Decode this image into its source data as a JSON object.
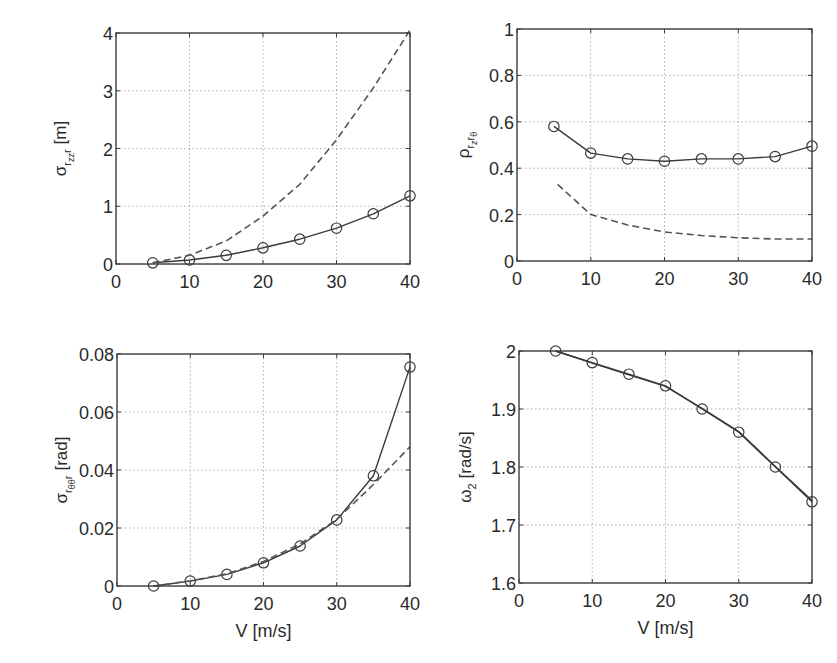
{
  "figure": {
    "background": "#ffffff",
    "line_color": "#3a3a3a",
    "dashed_color": "#555555",
    "grid_color": "#9a9a9a"
  },
  "chart_data": [
    {
      "id": "top-left",
      "type": "line",
      "title": "",
      "xlabel": "",
      "ylabel": {
        "symbol": "σ",
        "sub": "r",
        "subsub": "zz",
        "sub2": "r",
        "unit": "[m]"
      },
      "xlim": [
        0,
        40
      ],
      "ylim": [
        0,
        4
      ],
      "xticks": [
        0,
        10,
        20,
        30,
        40
      ],
      "yticks": [
        0,
        1,
        2,
        3,
        4
      ],
      "grid": true,
      "frame": {
        "x0": 116,
        "y0": 33,
        "x1": 410,
        "y1": 264
      },
      "x": [
        5,
        10,
        15,
        20,
        25,
        30,
        35,
        40
      ],
      "series": [
        {
          "name": "solid-with-markers",
          "style": "solid",
          "marker": "circle",
          "values": [
            0.02,
            0.07,
            0.15,
            0.28,
            0.43,
            0.62,
            0.87,
            1.18
          ]
        },
        {
          "name": "dashed",
          "style": "dashed",
          "marker": "none",
          "x": [
            5,
            10,
            15,
            20,
            25,
            30,
            35,
            40
          ],
          "values": [
            0.02,
            0.15,
            0.4,
            0.83,
            1.38,
            2.15,
            3.05,
            4.05
          ]
        }
      ]
    },
    {
      "id": "top-right",
      "type": "line",
      "title": "",
      "xlabel": "",
      "ylabel": {
        "symbol": "ρ",
        "sub": "r",
        "subsub": "z",
        "sub2": "r",
        "subsub2": "θ",
        "unit": ""
      },
      "xlim": [
        0,
        40
      ],
      "ylim": [
        0,
        1
      ],
      "xticks": [
        0,
        10,
        20,
        30,
        40
      ],
      "yticks": [
        0,
        0.2,
        0.4,
        0.6,
        0.8,
        1
      ],
      "ytick_labels": [
        "0",
        "0.2",
        "0.4",
        "0.6",
        "0.8",
        "1"
      ],
      "grid": true,
      "frame": {
        "x0": 517,
        "y0": 29,
        "x1": 812,
        "y1": 261
      },
      "x": [
        5,
        10,
        15,
        20,
        25,
        30,
        35,
        40
      ],
      "series": [
        {
          "name": "solid-with-markers",
          "style": "solid",
          "marker": "circle",
          "values": [
            0.58,
            0.465,
            0.44,
            0.43,
            0.44,
            0.44,
            0.45,
            0.495
          ]
        },
        {
          "name": "dashed",
          "style": "dashed",
          "marker": "none",
          "x": [
            5.5,
            10,
            15,
            20,
            25,
            30,
            35,
            40
          ],
          "values": [
            0.33,
            0.2,
            0.155,
            0.125,
            0.11,
            0.1,
            0.095,
            0.095
          ]
        }
      ]
    },
    {
      "id": "bottom-left",
      "type": "line",
      "title": "",
      "xlabel": "V [m/s]",
      "ylabel": {
        "symbol": "σ",
        "sub": "r",
        "subsub": "θθ",
        "sub2": "r",
        "unit": "[rad]"
      },
      "xlim": [
        0,
        40
      ],
      "ylim": [
        0,
        0.08
      ],
      "xticks": [
        0,
        10,
        20,
        30,
        40
      ],
      "yticks": [
        0,
        0.02,
        0.04,
        0.06,
        0.08
      ],
      "ytick_labels": [
        "0",
        "0.02",
        "0.04",
        "0.06",
        "0.08"
      ],
      "grid": true,
      "frame": {
        "x0": 117,
        "y0": 354,
        "x1": 410,
        "y1": 586
      },
      "x": [
        5,
        10,
        15,
        20,
        25,
        30,
        35,
        40
      ],
      "series": [
        {
          "name": "solid-with-markers",
          "style": "solid",
          "marker": "circle",
          "values": [
            0.0,
            0.0017,
            0.004,
            0.008,
            0.0138,
            0.0228,
            0.038,
            0.0755
          ]
        },
        {
          "name": "dashed",
          "style": "dashed",
          "marker": "none",
          "x": [
            5,
            10,
            15,
            20,
            25,
            30,
            35,
            40
          ],
          "values": [
            0.0,
            0.0018,
            0.0042,
            0.0085,
            0.0145,
            0.023,
            0.035,
            0.048
          ]
        }
      ]
    },
    {
      "id": "bottom-right",
      "type": "line",
      "title": "",
      "xlabel": "V [m/s]",
      "ylabel": {
        "symbol": "ω",
        "sub": "2",
        "unit": "[rad/s]"
      },
      "xlim": [
        0,
        40
      ],
      "ylim": [
        1.6,
        2.0
      ],
      "xticks": [
        0,
        10,
        20,
        30,
        40
      ],
      "yticks": [
        1.6,
        1.7,
        1.8,
        1.9,
        2.0
      ],
      "ytick_labels": [
        "1.6",
        "1.7",
        "1.8",
        "1.9",
        "2"
      ],
      "grid": true,
      "frame": {
        "x0": 519,
        "y0": 351,
        "x1": 812,
        "y1": 583
      },
      "x": [
        5,
        10,
        15,
        20,
        25,
        30,
        35,
        40
      ],
      "series": [
        {
          "name": "solid-with-markers",
          "style": "solid",
          "marker": "circle",
          "values": [
            2.0,
            1.98,
            1.96,
            1.94,
            1.9,
            1.86,
            1.8,
            1.74
          ]
        },
        {
          "name": "solid-overlay",
          "style": "solid",
          "marker": "none",
          "values": [
            2.0,
            1.979,
            1.959,
            1.939,
            1.901,
            1.861,
            1.801,
            1.742
          ]
        }
      ]
    }
  ]
}
